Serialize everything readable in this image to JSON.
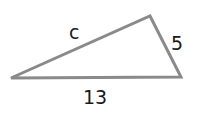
{
  "diagram": {
    "type": "triangle",
    "vertices": {
      "left": [
        11,
        78
      ],
      "top_right": [
        150,
        16
      ],
      "bottom_right": [
        181,
        77
      ]
    },
    "stroke_color": "#8a8a8a",
    "label_color": "#1a1a1a",
    "sides": [
      {
        "id": "hypotenuse",
        "label": "c"
      },
      {
        "id": "short_leg",
        "label": "5"
      },
      {
        "id": "base",
        "label": "13"
      }
    ]
  }
}
